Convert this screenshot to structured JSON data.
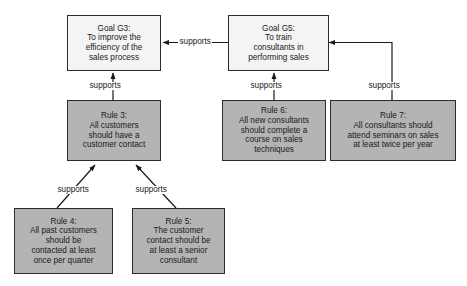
{
  "diagram": {
    "type": "goal-rule-support-graph",
    "background_color": "#ffffff",
    "goal_fill_color": "#f4f4f4",
    "rule_fill_color": "#b4b4b4",
    "border_color": "#2b2b2b",
    "nodes": [
      {
        "id": "goal-g3",
        "kind": "goal",
        "title": "Goal G3:",
        "body": "To improve the\nefficiency of the\nsales process",
        "text": "Goal G3:\nTo improve the\nefficiency of the\nsales process"
      },
      {
        "id": "goal-g5",
        "kind": "goal",
        "title": "Goal G5:",
        "body": "To train\nconsultants in\nperforming sales",
        "text": "Goal G5:\nTo train\nconsultants in\nperforming sales"
      },
      {
        "id": "rule-3",
        "kind": "rule",
        "title": "Rule 3:",
        "body": "All customers\nshould have a\ncustomer contact",
        "text": "Rule 3:\nAll customers\nshould have a\ncustomer contact"
      },
      {
        "id": "rule-6",
        "kind": "rule",
        "title": "Rule 6:",
        "body": "All new consultants\nshould complete a\ncourse on sales\ntechniques",
        "text": "Rule 6:\nAll new consultants\nshould complete a\ncourse on sales\ntechniques"
      },
      {
        "id": "rule-7",
        "kind": "rule",
        "title": "Rule 7:",
        "body": "All consultants should\nattend seminars on sales\nat least twice per year",
        "text": "Rule 7:\nAll consultants should\nattend seminars on sales\nat least twice per year"
      },
      {
        "id": "rule-4",
        "kind": "rule",
        "title": "Rule 4:",
        "body": "All past customers\nshould be\ncontacted at least\nonce per quarter",
        "text": "Rule 4:\nAll past customers\nshould be\ncontacted at least\nonce per quarter"
      },
      {
        "id": "rule-5",
        "kind": "rule",
        "title": "Rule 5:",
        "body": "The customer\ncontact should be\nat least a senior\nconsultant",
        "text": "Rule 5:\nThe customer\ncontact should be\nat least a senior\nconsultant"
      }
    ],
    "edges": [
      {
        "id": "edge-g5-to-g3",
        "from": "goal-g5",
        "to": "goal-g3",
        "label": "supports"
      },
      {
        "id": "edge-rule3-to-g3",
        "from": "rule-3",
        "to": "goal-g3",
        "label": "supports"
      },
      {
        "id": "edge-rule6-to-g5",
        "from": "rule-6",
        "to": "goal-g5",
        "label": "supports"
      },
      {
        "id": "edge-rule7-to-g5",
        "from": "rule-7",
        "to": "goal-g5",
        "label": "supports"
      },
      {
        "id": "edge-rule4-to-rule3",
        "from": "rule-4",
        "to": "rule-3",
        "label": "supports"
      },
      {
        "id": "edge-rule5-to-rule3",
        "from": "rule-5",
        "to": "rule-3",
        "label": "supports"
      }
    ]
  }
}
